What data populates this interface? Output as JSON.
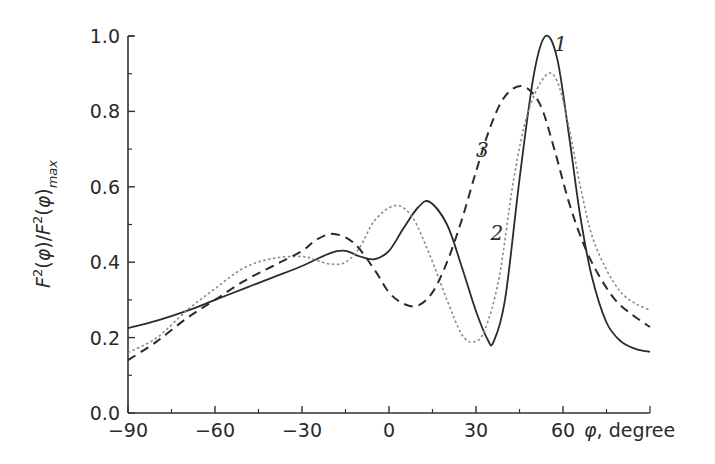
{
  "chart_data": {
    "type": "line",
    "title": "",
    "xlabel": "φ, degree",
    "ylabel": "F²(φ)/F²(φ)max",
    "xlim": [
      -90,
      90
    ],
    "ylim": [
      0.0,
      1.0
    ],
    "xticks": [
      -90,
      -60,
      -30,
      0,
      30,
      60
    ],
    "xtick_labels": [
      "−90",
      "−60",
      "−30",
      "0",
      "30",
      "60"
    ],
    "x_minor_ticks": [
      -75,
      -45,
      -15,
      15,
      45,
      75,
      90
    ],
    "yticks": [
      0.0,
      0.2,
      0.4,
      0.6,
      0.8,
      1.0
    ],
    "ytick_labels": [
      "0.0",
      "0.2",
      "0.4",
      "0.6",
      "0.8",
      "1.0"
    ],
    "y_minor_ticks": [
      0.1,
      0.3,
      0.5,
      0.7,
      0.9
    ],
    "grid": false,
    "legend": "inline curve labels",
    "series": [
      {
        "name": "1",
        "style": "solid",
        "x": [
          -90,
          -80,
          -70,
          -60,
          -50,
          -40,
          -30,
          -20,
          -15,
          -10,
          -5,
          0,
          5,
          10,
          14,
          20,
          25,
          30,
          34,
          36,
          40,
          45,
          50,
          54,
          58,
          62,
          66,
          70,
          75,
          80,
          85,
          90
        ],
        "values": [
          0.225,
          0.245,
          0.27,
          0.3,
          0.33,
          0.36,
          0.39,
          0.425,
          0.43,
          0.415,
          0.408,
          0.43,
          0.49,
          0.545,
          0.56,
          0.5,
          0.39,
          0.27,
          0.195,
          0.188,
          0.3,
          0.62,
          0.9,
          1.0,
          0.94,
          0.74,
          0.52,
          0.36,
          0.24,
          0.19,
          0.17,
          0.162
        ],
        "label_pos": [
          57,
          0.96
        ]
      },
      {
        "name": "2",
        "style": "dotted",
        "x": [
          -90,
          -80,
          -70,
          -60,
          -50,
          -40,
          -30,
          -25,
          -20,
          -15,
          -10,
          -5,
          2,
          8,
          14,
          20,
          25,
          29,
          33,
          38,
          43,
          48,
          54,
          58,
          62,
          66,
          70,
          75,
          80,
          85,
          90
        ],
        "values": [
          0.16,
          0.2,
          0.27,
          0.33,
          0.385,
          0.41,
          0.415,
          0.405,
          0.395,
          0.4,
          0.44,
          0.51,
          0.55,
          0.52,
          0.42,
          0.3,
          0.21,
          0.188,
          0.22,
          0.36,
          0.62,
          0.8,
          0.895,
          0.88,
          0.76,
          0.6,
          0.47,
          0.38,
          0.32,
          0.29,
          0.273
        ],
        "label_pos": [
          35,
          0.46
        ]
      },
      {
        "name": "3",
        "style": "dashed",
        "x": [
          -90,
          -80,
          -70,
          -60,
          -50,
          -40,
          -30,
          -25,
          -19,
          -12,
          -5,
          0,
          5,
          10,
          15,
          20,
          25,
          30,
          35,
          40,
          46,
          52,
          57,
          62,
          67,
          72,
          78,
          84,
          90
        ],
        "values": [
          0.14,
          0.19,
          0.25,
          0.3,
          0.35,
          0.39,
          0.43,
          0.46,
          0.475,
          0.45,
          0.38,
          0.32,
          0.29,
          0.285,
          0.32,
          0.4,
          0.51,
          0.64,
          0.76,
          0.84,
          0.867,
          0.82,
          0.7,
          0.56,
          0.45,
          0.37,
          0.3,
          0.26,
          0.228
        ],
        "label_pos": [
          30,
          0.68
        ]
      }
    ]
  }
}
